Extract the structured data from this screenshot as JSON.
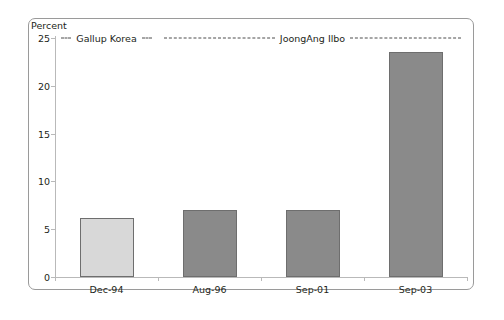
{
  "chart_data": {
    "type": "bar",
    "title": "",
    "xlabel": "",
    "ylabel": "Percent",
    "categories": [
      "Dec-94",
      "Aug-96",
      "Sep-01",
      "Sep-03"
    ],
    "values": [
      6.2,
      7.0,
      7.0,
      23.5
    ],
    "ylim": [
      0,
      25
    ],
    "yticks": [
      0,
      5,
      10,
      15,
      20,
      25
    ],
    "ytick_labels": [
      "0",
      "5",
      "10",
      "15",
      "20",
      "25"
    ],
    "grid": false,
    "legend_position": "none",
    "series": [
      {
        "name": "Percent",
        "values": [
          6.2,
          7.0,
          7.0,
          23.5
        ],
        "colors": [
          "#d8d8d8",
          "#8a8a8a",
          "#8a8a8a",
          "#8a8a8a"
        ]
      }
    ],
    "annotations": [
      {
        "text": "Gallup Korea",
        "covers": [
          "Dec-94"
        ],
        "style": "dashed-bracket"
      },
      {
        "text": "JoongAng Ilbo",
        "covers": [
          "Aug-96",
          "Sep-01",
          "Sep-03"
        ],
        "style": "dashed-bracket"
      }
    ]
  },
  "axis": {
    "unit_caption": "Percent"
  },
  "colors": {
    "bar_light": "#d8d8d8",
    "bar_dark": "#8a8a8a",
    "bar_edge": "#6e6e6e",
    "axis": "#b9b9b9",
    "frame": "#9a9a9a",
    "text": "#231f20",
    "background": "#ffffff"
  }
}
